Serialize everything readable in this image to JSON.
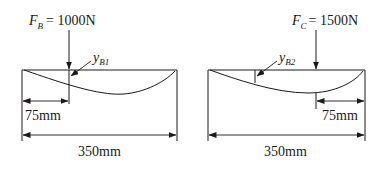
{
  "diagrams": [
    {
      "id": "left",
      "force": {
        "symbol": "F",
        "subscript": "B",
        "equals": "= 1000N",
        "value_N": 1000
      },
      "deflection": {
        "symbol": "y",
        "subscript": "B1"
      },
      "dims": {
        "partial": "75mm",
        "total": "350mm"
      },
      "load_position_from": "left"
    },
    {
      "id": "right",
      "force": {
        "symbol": "F",
        "subscript": "C",
        "equals": "= 1500N",
        "value_N": 1500
      },
      "deflection": {
        "symbol": "y",
        "subscript": "B2"
      },
      "dims": {
        "partial": "75mm",
        "total": "350mm"
      },
      "load_position_from": "right"
    }
  ],
  "colors": {
    "ink": "#1a1a1a",
    "background": "#ffffff"
  }
}
